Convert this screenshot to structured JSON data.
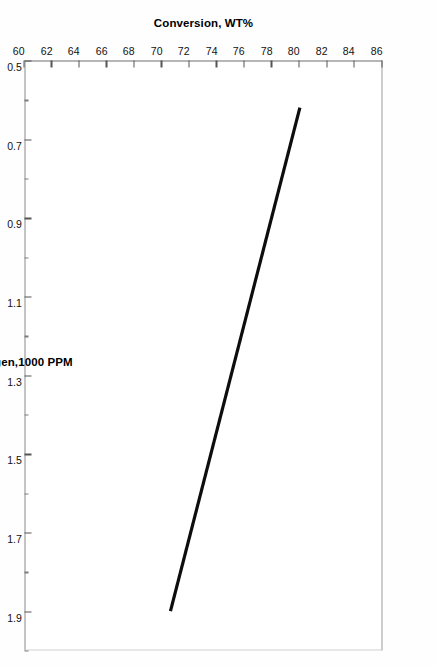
{
  "chart_data": {
    "type": "line",
    "title": "",
    "xlabel": "Total Nitrogen,1000 PPM",
    "ylabel": "Conversion, WT%",
    "xlim": [
      0.5,
      2.0
    ],
    "ylim": [
      60,
      86
    ],
    "grid": false,
    "legend": null,
    "orientation_note": "scanned page rotated 90 degrees",
    "xticks": [
      0.5,
      0.7,
      0.9,
      1.1,
      1.3,
      1.5,
      1.7,
      1.9
    ],
    "xticklabels": [
      "0.5",
      "0.7",
      "0.9",
      "1.1",
      "1.3",
      "1.5",
      "1.7",
      "1.9"
    ],
    "xminor": [
      0.6,
      0.8,
      1.0,
      1.2,
      1.4,
      1.6,
      1.8,
      2.0
    ],
    "yticks": [
      60,
      62,
      64,
      66,
      68,
      70,
      72,
      74,
      76,
      78,
      80,
      82,
      84,
      86
    ],
    "yticklabels": [
      "60",
      "62",
      "64",
      "66",
      "68",
      "70",
      "72",
      "74",
      "76",
      "78",
      "80",
      "82",
      "84",
      "86"
    ],
    "series": [
      {
        "name": "conversion",
        "color": "#0d0d0d",
        "linewidth": 3.2,
        "x": [
          0.62,
          1.9
        ],
        "values": [
          80.0,
          70.6
        ]
      }
    ]
  },
  "figure": {
    "background_color": "#ffffff",
    "frame_color": "#6e6e6e",
    "tick_color": "#555555",
    "text_color": "#111111"
  }
}
